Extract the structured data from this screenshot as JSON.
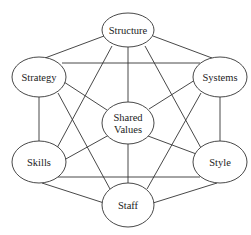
{
  "diagram": {
    "title": "",
    "nodes": [
      {
        "id": "structure",
        "label": "Structure",
        "cx": 128,
        "cy": 30,
        "rx": 26,
        "ry": 17
      },
      {
        "id": "strategy",
        "label": "Strategy",
        "cx": 39,
        "cy": 77,
        "rx": 27,
        "ry": 20
      },
      {
        "id": "systems",
        "label": "Systems",
        "cx": 220,
        "cy": 77,
        "rx": 27,
        "ry": 20
      },
      {
        "id": "shared-values",
        "label": "Shared",
        "label2": "Values",
        "cx": 128,
        "cy": 123,
        "rx": 26,
        "ry": 21
      },
      {
        "id": "skills",
        "label": "Skills",
        "cx": 39,
        "cy": 162,
        "rx": 27,
        "ry": 21
      },
      {
        "id": "style",
        "label": "Style",
        "cx": 220,
        "cy": 162,
        "rx": 27,
        "ry": 21
      },
      {
        "id": "staff",
        "label": "Staff",
        "cx": 128,
        "cy": 205,
        "rx": 26,
        "ry": 22
      }
    ],
    "edges": [
      {
        "from": "structure",
        "to": "strategy",
        "x1": 104,
        "y1": 36,
        "x2": 45,
        "y2": 58
      },
      {
        "from": "structure",
        "to": "systems",
        "x1": 153,
        "y1": 36,
        "x2": 212,
        "y2": 58
      },
      {
        "from": "strategy",
        "to": "systems",
        "x1": 62,
        "y1": 63,
        "x2": 200,
        "y2": 63
      },
      {
        "from": "strategy",
        "to": "skills",
        "x1": 39,
        "y1": 97,
        "x2": 39,
        "y2": 142
      },
      {
        "from": "systems",
        "to": "style",
        "x1": 220,
        "y1": 97,
        "x2": 220,
        "y2": 142
      },
      {
        "from": "skills",
        "to": "style",
        "x1": 58,
        "y1": 177,
        "x2": 200,
        "y2": 177
      },
      {
        "from": "skills",
        "to": "staff",
        "x1": 42,
        "y1": 183,
        "x2": 104,
        "y2": 203
      },
      {
        "from": "style",
        "to": "staff",
        "x1": 217,
        "y1": 183,
        "x2": 153,
        "y2": 203
      },
      {
        "from": "structure",
        "to": "shared-values",
        "x1": 128,
        "y1": 47,
        "x2": 128,
        "y2": 102
      },
      {
        "from": "shared-values",
        "to": "staff",
        "x1": 128,
        "y1": 144,
        "x2": 128,
        "y2": 183
      },
      {
        "from": "strategy",
        "to": "shared-values",
        "x1": 64,
        "y1": 82,
        "x2": 107,
        "y2": 110
      },
      {
        "from": "systems",
        "to": "shared-values",
        "x1": 195,
        "y1": 80,
        "x2": 149,
        "y2": 109
      },
      {
        "from": "skills",
        "to": "shared-values",
        "x1": 64,
        "y1": 160,
        "x2": 109,
        "y2": 135
      },
      {
        "from": "style",
        "to": "shared-values",
        "x1": 199,
        "y1": 155,
        "x2": 148,
        "y2": 136
      },
      {
        "from": "structure",
        "to": "skills",
        "x1": 112,
        "y1": 46,
        "x2": 57,
        "y2": 148
      },
      {
        "from": "structure",
        "to": "style",
        "x1": 145,
        "y1": 46,
        "x2": 201,
        "y2": 148
      },
      {
        "from": "strategy",
        "to": "staff",
        "x1": 58,
        "y1": 93,
        "x2": 110,
        "y2": 189
      },
      {
        "from": "systems",
        "to": "staff",
        "x1": 201,
        "y1": 93,
        "x2": 147,
        "y2": 189
      }
    ]
  }
}
